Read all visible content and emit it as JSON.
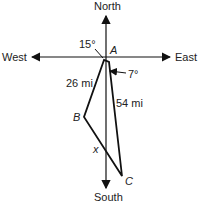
{
  "diagram": {
    "directions": {
      "north": "North",
      "south": "South",
      "east": "East",
      "west": "West"
    },
    "points": {
      "a": "A",
      "b": "B",
      "c": "C"
    },
    "angles": {
      "ab_from_south": "15°",
      "ac_from_south": "7°"
    },
    "sides": {
      "ab": "26 mi",
      "ac": "54 mi",
      "bc": "x"
    },
    "colors": {
      "line": "#111111",
      "text": "#222222"
    }
  }
}
